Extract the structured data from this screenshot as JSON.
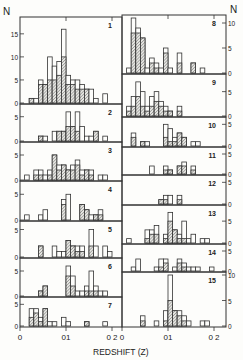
{
  "figure": {
    "ylabel_left": "N",
    "ylabel_right": "N",
    "xlabel": "REDSHIFT (Z)",
    "xticks": [
      "0",
      "0.1",
      "0.2"
    ],
    "xtick_labels_display": [
      "0",
      "01",
      "0 2"
    ]
  },
  "chart_data": {
    "type": "bar",
    "title": "",
    "xlabel": "REDSHIFT (Z)",
    "ylabel": "N",
    "bin_width": 0.01,
    "xlim": [
      0,
      0.22
    ],
    "grid": false,
    "legend": "none; open bars = total counts, hatched bars = subset",
    "panels": [
      {
        "id": "1",
        "column": "left",
        "ylim": [
          0,
          18
        ],
        "yticks": [
          0,
          5,
          10,
          15
        ],
        "bin_starts": [
          0.02,
          0.03,
          0.04,
          0.05,
          0.06,
          0.07,
          0.08,
          0.09,
          0.1,
          0.11,
          0.12,
          0.13,
          0.14,
          0.15,
          0.16,
          0.17,
          0.18
        ],
        "total": [
          1,
          1,
          5,
          4,
          10,
          8,
          9,
          16,
          6,
          5,
          5,
          4,
          3,
          3,
          1,
          0,
          2
        ],
        "hatched": [
          1,
          0,
          4,
          4,
          5,
          5,
          6,
          10,
          4,
          4,
          3,
          3,
          3,
          0,
          0,
          0,
          0
        ]
      },
      {
        "id": "2",
        "column": "left",
        "ylim": [
          0,
          7
        ],
        "yticks": [
          0,
          5
        ],
        "bin_starts": [
          0.04,
          0.05,
          0.06,
          0.07,
          0.08,
          0.09,
          0.1,
          0.11,
          0.12,
          0.13,
          0.14,
          0.15,
          0.16,
          0.17,
          0.18
        ],
        "total": [
          1,
          1,
          0,
          2,
          2,
          2,
          6,
          3,
          6,
          3,
          1,
          1,
          2,
          0,
          1
        ],
        "hatched": [
          1,
          0,
          0,
          0,
          2,
          2,
          3,
          3,
          2,
          0,
          0,
          0,
          2,
          0,
          0
        ]
      },
      {
        "id": "3",
        "column": "left",
        "ylim": [
          0,
          7
        ],
        "yticks": [
          0,
          5
        ],
        "bin_starts": [
          0.01,
          0.02,
          0.03,
          0.04,
          0.05,
          0.06,
          0.07,
          0.08,
          0.09,
          0.1,
          0.11,
          0.12,
          0.13,
          0.14,
          0.15,
          0.16,
          0.17,
          0.18,
          0.19
        ],
        "total": [
          1,
          0,
          2,
          2,
          1,
          2,
          5,
          3,
          3,
          2,
          3,
          4,
          2,
          2,
          2,
          0,
          1,
          1,
          0
        ],
        "hatched": [
          0,
          0,
          1,
          1,
          0,
          1,
          5,
          2,
          3,
          2,
          2,
          3,
          1,
          2,
          1,
          0,
          0,
          0,
          0
        ]
      },
      {
        "id": "4",
        "column": "left",
        "ylim": [
          0,
          7
        ],
        "yticks": [
          0,
          5
        ],
        "bin_starts": [
          0.01,
          0.02,
          0.03,
          0.04,
          0.05,
          0.06,
          0.07,
          0.08,
          0.09,
          0.1,
          0.11,
          0.12,
          0.13,
          0.14,
          0.15,
          0.16,
          0.17
        ],
        "total": [
          1,
          0,
          0,
          1,
          2,
          0,
          0,
          0,
          4,
          5,
          0,
          0,
          3,
          2,
          1,
          1,
          2
        ],
        "hatched": [
          0,
          0,
          0,
          0,
          0,
          0,
          0,
          0,
          3,
          0,
          0,
          0,
          3,
          2,
          0,
          1,
          1
        ]
      },
      {
        "id": "5",
        "column": "left",
        "ylim": [
          0,
          6
        ],
        "yticks": [
          0,
          5
        ],
        "bin_starts": [
          0.04,
          0.05,
          0.06,
          0.07,
          0.08,
          0.09,
          0.1,
          0.11,
          0.12,
          0.13,
          0.14,
          0.15,
          0.16,
          0.17,
          0.18,
          0.19
        ],
        "total": [
          2,
          0,
          0,
          2,
          1,
          1,
          3,
          2,
          2,
          2,
          0,
          5,
          2,
          0,
          2,
          1
        ],
        "hatched": [
          2,
          0,
          0,
          0,
          0,
          0,
          3,
          2,
          1,
          1,
          0,
          2,
          0,
          0,
          0,
          0
        ]
      },
      {
        "id": "6",
        "column": "left",
        "ylim": [
          0,
          7
        ],
        "yticks": [
          0,
          5
        ],
        "bin_starts": [
          0.04,
          0.05,
          0.06,
          0.07,
          0.08,
          0.09,
          0.1,
          0.11,
          0.12,
          0.13,
          0.14,
          0.15,
          0.16,
          0.17,
          0.18
        ],
        "total": [
          1,
          2,
          0,
          0,
          0,
          0,
          6,
          4,
          1,
          1,
          2,
          5,
          2,
          1,
          1
        ],
        "hatched": [
          1,
          2,
          0,
          0,
          0,
          0,
          4,
          2,
          0,
          0,
          1,
          1,
          1,
          0,
          0
        ]
      },
      {
        "id": "7",
        "column": "left",
        "ylim": [
          0,
          6
        ],
        "yticks": [
          0,
          5
        ],
        "bin_starts": [
          0.02,
          0.03,
          0.04,
          0.05,
          0.06,
          0.07,
          0.08,
          0.09,
          0.1,
          0.11,
          0.12,
          0.13,
          0.14,
          0.15,
          0.16,
          0.17,
          0.18
        ],
        "total": [
          4,
          4,
          2,
          4,
          1,
          1,
          0,
          2,
          1,
          0,
          0,
          0,
          1,
          0,
          0,
          0,
          1
        ],
        "hatched": [
          2,
          3,
          1,
          4,
          0,
          0,
          0,
          0,
          0,
          0,
          0,
          0,
          1,
          0,
          0,
          0,
          0
        ]
      },
      {
        "id": "8",
        "column": "right",
        "ylim": [
          0,
          11
        ],
        "yticks": [
          0,
          5,
          10
        ],
        "tick_side": "right",
        "bin_starts": [
          0.01,
          0.02,
          0.03,
          0.04,
          0.05,
          0.06,
          0.07,
          0.08,
          0.09,
          0.1,
          0.11,
          0.12,
          0.13,
          0.14,
          0.15,
          0.16,
          0.17,
          0.18
        ],
        "total": [
          1,
          11,
          9,
          7,
          1,
          3,
          2,
          1,
          5,
          1,
          0,
          4,
          0,
          0,
          2,
          0,
          1,
          0
        ],
        "hatched": [
          0,
          8,
          8,
          7,
          0,
          2,
          1,
          0,
          4,
          0,
          0,
          2,
          0,
          0,
          2,
          0,
          0,
          0
        ]
      },
      {
        "id": "9",
        "column": "right",
        "ylim": [
          0,
          8
        ],
        "yticks": [
          0,
          5
        ],
        "tick_side": "right",
        "bin_starts": [
          0.01,
          0.02,
          0.03,
          0.04,
          0.05,
          0.06,
          0.07,
          0.08,
          0.09,
          0.1,
          0.11,
          0.12,
          0.13
        ],
        "total": [
          2,
          4,
          7,
          5,
          2,
          4,
          5,
          3,
          2,
          1,
          0,
          2,
          0
        ],
        "hatched": [
          1,
          2,
          4,
          2,
          1,
          2,
          3,
          2,
          1,
          1,
          0,
          1,
          0
        ]
      },
      {
        "id": "10",
        "column": "right",
        "ylim": [
          0,
          6
        ],
        "yticks": [
          0,
          5
        ],
        "tick_side": "right",
        "bin_starts": [
          0.02,
          0.03,
          0.04,
          0.05,
          0.06,
          0.07,
          0.08,
          0.09,
          0.1,
          0.11,
          0.12,
          0.13,
          0.14,
          0.15,
          0.16
        ],
        "total": [
          3,
          0,
          1,
          1,
          0,
          0,
          0,
          5,
          4,
          2,
          3,
          2,
          0,
          1,
          1
        ],
        "hatched": [
          2,
          0,
          1,
          0,
          0,
          0,
          0,
          2,
          1,
          1,
          3,
          2,
          0,
          0,
          0
        ]
      },
      {
        "id": "11",
        "column": "right",
        "ylim": [
          0,
          6
        ],
        "yticks": [
          0,
          5
        ],
        "tick_side": "right",
        "bin_starts": [
          0.06,
          0.07,
          0.08,
          0.09,
          0.1,
          0.11,
          0.12,
          0.13,
          0.14,
          0.15
        ],
        "total": [
          2,
          0,
          0,
          2,
          1,
          0,
          2,
          3,
          0,
          2
        ],
        "hatched": [
          0,
          0,
          0,
          1,
          1,
          0,
          2,
          2,
          0,
          1
        ]
      },
      {
        "id": "12",
        "column": "right",
        "ylim": [
          0,
          6
        ],
        "yticks": [
          0,
          5
        ],
        "tick_side": "right",
        "bin_starts": [
          0.08,
          0.09,
          0.1,
          0.11,
          0.12
        ],
        "total": [
          1,
          2,
          2,
          0,
          2
        ],
        "hatched": [
          1,
          1,
          0,
          0,
          1
        ]
      },
      {
        "id": "13",
        "column": "right",
        "ylim": [
          0,
          8
        ],
        "yticks": [
          0,
          5
        ],
        "tick_side": "right",
        "bin_starts": [
          0.01,
          0.02,
          0.03,
          0.04,
          0.05,
          0.06,
          0.07,
          0.08,
          0.09,
          0.1,
          0.11,
          0.12,
          0.13,
          0.14,
          0.15,
          0.16,
          0.17,
          0.18
        ],
        "total": [
          1,
          0,
          0,
          0,
          3,
          3,
          4,
          0,
          2,
          7,
          3,
          2,
          5,
          1,
          2,
          0,
          1,
          1
        ],
        "hatched": [
          0,
          0,
          0,
          0,
          1,
          2,
          2,
          0,
          1,
          5,
          3,
          1,
          1,
          0,
          0,
          0,
          0,
          0
        ]
      },
      {
        "id": "14",
        "column": "right",
        "ylim": [
          0,
          6
        ],
        "yticks": [
          0,
          5
        ],
        "tick_side": "right",
        "bin_starts": [
          0.02,
          0.03,
          0.04,
          0.05,
          0.06,
          0.07,
          0.08,
          0.09,
          0.1,
          0.11,
          0.12,
          0.13,
          0.14,
          0.15,
          0.16,
          0.17,
          0.18,
          0.19
        ],
        "total": [
          1,
          3,
          0,
          0,
          0,
          1,
          3,
          3,
          0,
          1,
          3,
          2,
          1,
          1,
          1,
          0,
          0,
          1
        ],
        "hatched": [
          0,
          0,
          0,
          0,
          0,
          0,
          1,
          2,
          0,
          0,
          2,
          1,
          0,
          0,
          0,
          0,
          0,
          0
        ]
      },
      {
        "id": "15",
        "column": "right",
        "ylim": [
          0,
          10
        ],
        "yticks": [
          0,
          5,
          10
        ],
        "tick_side": "right",
        "bin_starts": [
          0.04,
          0.05,
          0.06,
          0.07,
          0.08,
          0.09,
          0.1,
          0.11,
          0.12,
          0.13,
          0.14,
          0.15,
          0.16,
          0.17,
          0.18,
          0.19
        ],
        "total": [
          2,
          0,
          0,
          1,
          0,
          3,
          10,
          3,
          3,
          2,
          1,
          0,
          0,
          1,
          1,
          0
        ],
        "hatched": [
          1,
          0,
          0,
          0,
          0,
          1,
          5,
          3,
          2,
          1,
          0,
          0,
          0,
          0,
          0,
          0
        ]
      }
    ]
  },
  "layout": {
    "left": {
      "x0": 20,
      "x1": 122,
      "zpx": 460,
      "panels_y": [
        [
          17,
          104
        ],
        [
          104,
          142
        ],
        [
          142,
          181
        ],
        [
          181,
          221
        ],
        [
          221,
          258
        ],
        [
          258,
          297
        ],
        [
          297,
          327
        ]
      ]
    },
    "right": {
      "x0": 122,
      "x1": 226,
      "zpx": 460,
      "panels_y": [
        [
          15,
          74
        ],
        [
          74,
          117
        ],
        [
          117,
          147
        ],
        [
          147,
          175
        ],
        [
          175,
          205
        ],
        [
          205,
          244
        ],
        [
          244,
          272
        ],
        [
          272,
          327
        ]
      ]
    }
  }
}
